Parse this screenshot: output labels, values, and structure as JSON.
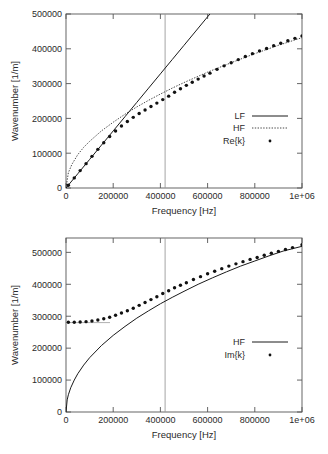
{
  "figure": {
    "panels": [
      {
        "id": "top",
        "name": "real-part-panel",
        "chart_data": {
          "type": "line",
          "title": "",
          "xlabel": "Frequency [Hz]",
          "ylabel": "Wavenumber [1/m]",
          "xlim": [
            0,
            1000000
          ],
          "ylim": [
            0,
            500000
          ],
          "xticks": [
            0,
            200000,
            400000,
            600000,
            800000,
            1000000
          ],
          "xticklabels": [
            "0",
            "200000",
            "400000",
            "600000",
            "800000",
            "1e+06"
          ],
          "yticks": [
            0,
            100000,
            200000,
            300000,
            400000,
            500000
          ],
          "yticklabels": [
            "0",
            "100000",
            "200000",
            "300000",
            "400000",
            "500000"
          ],
          "grid": false,
          "legend_position": "right-middle",
          "annotations": [
            {
              "type": "vertical-line",
              "x": 420000,
              "label": ""
            }
          ],
          "series": [
            {
              "name": "LF",
              "style": "solid-line",
              "x": [
                0,
                50000,
                100000,
                150000,
                200000,
                250000,
                300000,
                350000,
                400000,
                450000,
                500000,
                550000,
                600000,
                620000
              ],
              "values": [
                0,
                41000,
                82000,
                123000,
                164000,
                205000,
                246000,
                287000,
                328000,
                369000,
                410000,
                451000,
                492000,
                508000
              ]
            },
            {
              "name": "HF",
              "style": "dotted-line",
              "x": [
                0,
                10000,
                25000,
                50000,
                75000,
                100000,
                150000,
                200000,
                250000,
                300000,
                350000,
                400000,
                450000,
                500000,
                600000,
                700000,
                800000,
                900000,
                1000000
              ],
              "values": [
                0,
                44000,
                68000,
                96000,
                117000,
                134000,
                164000,
                189000,
                212000,
                233000,
                252000,
                270000,
                287000,
                303000,
                333000,
                360000,
                386000,
                410000,
                432000
              ]
            },
            {
              "name": "Re{k}",
              "style": "dots",
              "x": [
                10000,
                35000,
                60000,
                85000,
                110000,
                135000,
                160000,
                185000,
                210000,
                235000,
                260000,
                285000,
                310000,
                335000,
                360000,
                385000,
                410000,
                435000,
                460000,
                485000,
                510000,
                535000,
                560000,
                585000,
                610000,
                640000,
                670000,
                700000,
                730000,
                760000,
                790000,
                820000,
                850000,
                880000,
                910000,
                940000,
                970000,
                1000000
              ],
              "values": [
                8000,
                29000,
                50000,
                70000,
                91000,
                111000,
                130000,
                148000,
                164000,
                178000,
                191000,
                203000,
                214000,
                224000,
                234000,
                244000,
                254000,
                264000,
                275000,
                285000,
                295000,
                304000,
                313000,
                322000,
                330000,
                341000,
                351000,
                360000,
                369000,
                378000,
                386000,
                394000,
                401000,
                409000,
                416000,
                423000,
                430000,
                437000
              ]
            }
          ],
          "legend": [
            {
              "label": "LF",
              "style": "solid-line"
            },
            {
              "label": "HF",
              "style": "dotted-line"
            },
            {
              "label": "Re{k}",
              "style": "dots"
            }
          ]
        }
      },
      {
        "id": "bottom",
        "name": "imag-part-panel",
        "chart_data": {
          "type": "line",
          "title": "",
          "xlabel": "Frequency [Hz]",
          "ylabel": "Wavenumber [1/m]",
          "xlim": [
            0,
            1000000
          ],
          "ylim": [
            0,
            545000
          ],
          "xticks": [
            0,
            200000,
            400000,
            600000,
            800000,
            1000000
          ],
          "xticklabels": [
            "0",
            "200000",
            "400000",
            "600000",
            "800000",
            "1e+06"
          ],
          "yticks": [
            0,
            100000,
            200000,
            300000,
            400000,
            500000
          ],
          "yticklabels": [
            "0",
            "100000",
            "200000",
            "300000",
            "400000",
            "500000"
          ],
          "grid": false,
          "legend_position": "right-middle",
          "annotations": [
            {
              "type": "vertical-line",
              "x": 420000,
              "label": ""
            },
            {
              "type": "horizontal-segment",
              "y": 280000,
              "x0": 0,
              "x1": 185000,
              "label": ""
            }
          ],
          "series": [
            {
              "name": "HF",
              "style": "solid-line",
              "x": [
                0,
                5000,
                10000,
                20000,
                35000,
                50000,
                75000,
                100000,
                150000,
                200000,
                250000,
                300000,
                350000,
                400000,
                450000,
                500000,
                560000,
                620000,
                680000,
                740000,
                800000,
                860000,
                920000,
                1000000
              ],
              "values": [
                0,
                38000,
                54000,
                76000,
                100000,
                120000,
                147000,
                170000,
                208000,
                240000,
                268000,
                294000,
                317000,
                339000,
                359000,
                378000,
                400000,
                420000,
                439000,
                457000,
                473000,
                489000,
                504000,
                519000
              ]
            },
            {
              "name": "Im{k}",
              "style": "dots",
              "x": [
                10000,
                35000,
                60000,
                85000,
                110000,
                135000,
                160000,
                185000,
                210000,
                235000,
                260000,
                285000,
                310000,
                335000,
                360000,
                385000,
                410000,
                435000,
                460000,
                485000,
                510000,
                540000,
                570000,
                600000,
                630000,
                660000,
                690000,
                720000,
                750000,
                780000,
                810000,
                840000,
                870000,
                900000,
                930000,
                960000,
                1000000
              ],
              "values": [
                281000,
                281000,
                282000,
                283000,
                285000,
                288000,
                292000,
                297000,
                303000,
                310000,
                317000,
                325000,
                334000,
                343000,
                352000,
                361000,
                371000,
                380000,
                389000,
                397000,
                405000,
                415000,
                424000,
                433000,
                441000,
                449000,
                457000,
                464000,
                471000,
                478000,
                484000,
                491000,
                497000,
                503000,
                509000,
                515000,
                524000
              ]
            }
          ],
          "legend": [
            {
              "label": "HF",
              "style": "solid-line"
            },
            {
              "label": "Im{k}",
              "style": "dots"
            }
          ]
        }
      }
    ]
  },
  "colors": {
    "background": "#ffffff",
    "axis": "#555555",
    "data": "#111111",
    "marker": "#9a9a9a"
  }
}
